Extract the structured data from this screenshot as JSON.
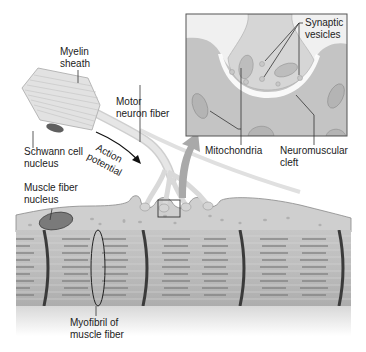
{
  "diagram": {
    "colors": {
      "background": "#ffffff",
      "inset_bg": "#ececec",
      "inset_border": "#555555",
      "muscle_fill": "#b9b9b9",
      "muscle_stripe": "#8f8f8f",
      "muscle_band": "#3b3b3b",
      "neuron_fill": "#d9d9d9",
      "myelin_fill": "#dedede",
      "nucleus_fill": "#6f6f6f",
      "sarcolemma_fill": "#d2d2d2",
      "arrow_fill": "#a9a9a9",
      "leader_line": "#333333"
    },
    "labels": {
      "myelin_sheath": [
        "Myelin",
        "sheath"
      ],
      "motor_neuron_fiber": [
        "Motor",
        "neuron fiber"
      ],
      "schwann_cell_nucleus": [
        "Schwann cell",
        "nucleus"
      ],
      "action_potential": [
        "Action",
        "potential"
      ],
      "muscle_fiber_nucleus": [
        "Muscle fiber",
        "nucleus"
      ],
      "myofibril": [
        "Myofibril of",
        "muscle fiber"
      ],
      "synaptic_vesicles": [
        "Synaptic",
        "vesicles"
      ],
      "mitochondria": [
        "Mitochondria"
      ],
      "neuromuscular_cleft": [
        "Neuromuscular",
        "cleft"
      ]
    }
  }
}
